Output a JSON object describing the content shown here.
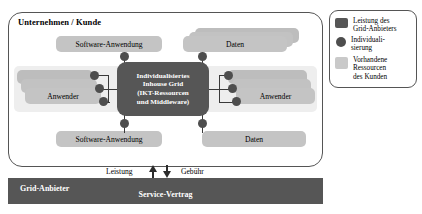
{
  "diagram": {
    "customer": {
      "title": "Unternehmen / Kunde"
    },
    "core": {
      "line1": "Individualisiertes",
      "line2": "Inhouse Grid",
      "line3": "(IKT-Ressourcen",
      "line4": "und Middleware)"
    },
    "resources": {
      "software_top": "Software-Anwendung",
      "software_bottom": "Software-Anwendung",
      "data_top": "Daten",
      "data_bottom": "Daten",
      "users_left": "Anwender",
      "users_right": "Anwender"
    },
    "provider": {
      "label": "Grid-Anbieter",
      "contract": "Service-Vertrag"
    },
    "exchange": {
      "service": "Leistung",
      "fee": "Gebühr"
    },
    "legend": {
      "items": [
        {
          "label_line1": "Leistung des",
          "label_line2": "Grid-Anbieters",
          "swatch": "dark-rect"
        },
        {
          "label_line1": "Individuali-",
          "label_line2": "sierung",
          "swatch": "dark-circle"
        },
        {
          "label_line1": "Vorhandene",
          "label_line2": "Ressourcen",
          "label_line3": "des Kunden",
          "swatch": "light-rect"
        }
      ]
    },
    "colors": {
      "dark": "#565656",
      "dot": "#4e4e4e",
      "light": "#c9c9c9",
      "band": "#eeeeee",
      "outline": "#555555"
    }
  }
}
